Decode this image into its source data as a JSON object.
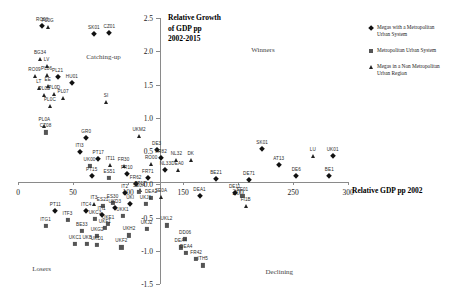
{
  "chart_data": {
    "type": "scatter",
    "title": "",
    "xlabel": "Relative GDP pp 2002",
    "ylabel": "Relative Growth of GDP pp 2002-2015",
    "ylabel_lines": [
      "Relative Growth",
      "of GDP pp",
      "2002-2015"
    ],
    "xlim": [
      0,
      300
    ],
    "ylim": [
      -1.5,
      2.5
    ],
    "xticks": [
      0,
      50,
      100,
      150,
      200,
      250,
      300
    ],
    "xtick_labels": [
      "0",
      "50",
      "100",
      "150",
      "200",
      "250",
      "300"
    ],
    "yticks": [
      -1.5,
      -1.0,
      -0.5,
      0.0,
      0.5,
      1.0,
      1.5,
      2.0,
      2.5
    ],
    "ytick_labels": [
      "-1.5",
      "-1.0",
      "-0.5",
      "0.0",
      "0.5",
      "1.0",
      "1.5",
      "2.0",
      "2.5"
    ],
    "grid": false,
    "legend_position": "top-right",
    "legend": [
      {
        "label": "Megas with a Metropolitan Urban System",
        "marker": "diamond",
        "color": "#111111"
      },
      {
        "label": "Metropolitan Urban System",
        "marker": "square",
        "color": "#555555"
      },
      {
        "label": "Megas in a Non Metropolitan Urban Region",
        "marker": "triangle",
        "color": "#222222"
      }
    ],
    "annotations": [
      {
        "text": "Catching-up",
        "x": 62,
        "y": 1.97
      },
      {
        "text": "Winners",
        "x": 212,
        "y": 2.08
      },
      {
        "text": "Losers",
        "x": 13,
        "y": -1.22
      },
      {
        "text": "Declining",
        "x": 225,
        "y": -1.26
      }
    ],
    "points": [
      {
        "label": "RO08",
        "x": 22,
        "y": 2.38,
        "marker": "diamond"
      },
      {
        "label": "PL0G",
        "x": 27,
        "y": 2.36,
        "marker": "triangle"
      },
      {
        "label": "SK01",
        "x": 69,
        "y": 2.26,
        "marker": "diamond"
      },
      {
        "label": "CZ01",
        "x": 83,
        "y": 2.27,
        "marker": "diamond"
      },
      {
        "label": "BG34",
        "x": 20,
        "y": 1.88,
        "marker": "triangle"
      },
      {
        "label": "LV",
        "x": 26,
        "y": 1.78,
        "marker": "triangle"
      },
      {
        "label": "RO09",
        "x": 15,
        "y": 1.63,
        "marker": "triangle"
      },
      {
        "label": "PL06",
        "x": 26,
        "y": 1.64,
        "marker": "triangle"
      },
      {
        "label": "PL21",
        "x": 36,
        "y": 1.62,
        "marker": "diamond"
      },
      {
        "label": "HU01",
        "x": 49,
        "y": 1.52,
        "marker": "diamond"
      },
      {
        "label": "LT",
        "x": 19,
        "y": 1.45,
        "marker": "triangle"
      },
      {
        "label": "EE",
        "x": 27,
        "y": 1.47,
        "marker": "triangle"
      },
      {
        "label": "PL0B",
        "x": 24,
        "y": 1.34,
        "marker": "triangle"
      },
      {
        "label": "PL0D",
        "x": 33,
        "y": 1.35,
        "marker": "triangle"
      },
      {
        "label": "PL07",
        "x": 41,
        "y": 1.3,
        "marker": "triangle"
      },
      {
        "label": "SI",
        "x": 80,
        "y": 1.24,
        "marker": "triangle"
      },
      {
        "label": "PL0C",
        "x": 29,
        "y": 1.18,
        "marker": "triangle"
      },
      {
        "label": "PL0A",
        "x": 24,
        "y": 0.88,
        "marker": "triangle"
      },
      {
        "label": "CZ08",
        "x": 25,
        "y": 0.78,
        "marker": "square"
      },
      {
        "label": "GR0",
        "x": 62,
        "y": 0.7,
        "marker": "diamond"
      },
      {
        "label": "UKM2",
        "x": 110,
        "y": 0.72,
        "marker": "triangle"
      },
      {
        "label": "ITI3",
        "x": 56,
        "y": 0.49,
        "marker": "diamond"
      },
      {
        "label": "DE3",
        "x": 126,
        "y": 0.52,
        "marker": "diamond"
      },
      {
        "label": "SK01",
        "x": 222,
        "y": 0.53,
        "marker": "diamond"
      },
      {
        "label": "LU",
        "x": 268,
        "y": 0.43,
        "marker": "triangle"
      },
      {
        "label": "UK01",
        "x": 286,
        "y": 0.43,
        "marker": "diamond"
      },
      {
        "label": "PT17",
        "x": 73,
        "y": 0.38,
        "marker": "diamond"
      },
      {
        "label": "FR82",
        "x": 130,
        "y": 0.4,
        "marker": "diamond"
      },
      {
        "label": "AT13",
        "x": 237,
        "y": 0.29,
        "marker": "diamond"
      },
      {
        "label": "RO00",
        "x": 121,
        "y": 0.31,
        "marker": "triangle"
      },
      {
        "label": "NL32",
        "x": 144,
        "y": 0.36,
        "marker": "triangle"
      },
      {
        "label": "DK",
        "x": 157,
        "y": 0.36,
        "marker": "triangle"
      },
      {
        "label": "UK00",
        "x": 65,
        "y": 0.27,
        "marker": "square"
      },
      {
        "label": "IT11",
        "x": 84,
        "y": 0.29,
        "marker": "triangle"
      },
      {
        "label": "FR30",
        "x": 96,
        "y": 0.27,
        "marker": "triangle"
      },
      {
        "label": "NL33",
        "x": 134,
        "y": 0.22,
        "marker": "diamond"
      },
      {
        "label": "DEA0",
        "x": 145,
        "y": 0.21,
        "marker": "triangle"
      },
      {
        "label": "FR10",
        "x": 99,
        "y": 0.16,
        "marker": "diamond"
      },
      {
        "label": "PT15",
        "x": 67,
        "y": 0.13,
        "marker": "diamond"
      },
      {
        "label": "ES51",
        "x": 83,
        "y": 0.1,
        "marker": "square"
      },
      {
        "label": "FR71",
        "x": 118,
        "y": 0.1,
        "marker": "diamond"
      },
      {
        "label": "DE6",
        "x": 253,
        "y": 0.12,
        "marker": "diamond"
      },
      {
        "label": "BE1",
        "x": 283,
        "y": 0.12,
        "marker": "diamond"
      },
      {
        "label": "DE71",
        "x": 210,
        "y": 0.07,
        "marker": "diamond"
      },
      {
        "label": "BE21",
        "x": 180,
        "y": 0.08,
        "marker": "diamond"
      },
      {
        "label": "FR62",
        "x": 107,
        "y": 0.01,
        "marker": "diamond"
      },
      {
        "label": "PT17",
        "x": 111,
        "y": -0.08,
        "marker": "triangle"
      },
      {
        "label": "IT2",
        "x": 97,
        "y": -0.13,
        "marker": "diamond"
      },
      {
        "label": "SE0A",
        "x": 110,
        "y": -0.12,
        "marker": "square"
      },
      {
        "label": "DE11",
        "x": 197,
        "y": -0.13,
        "marker": "diamond"
      },
      {
        "label": "SE01",
        "x": 204,
        "y": -0.17,
        "marker": "square"
      },
      {
        "label": "DEA1",
        "x": 165,
        "y": -0.18,
        "marker": "diamond"
      },
      {
        "label": "SE0A",
        "x": 130,
        "y": -0.19,
        "marker": "triangle"
      },
      {
        "label": "DEA2",
        "x": 121,
        "y": -0.2,
        "marker": "square"
      },
      {
        "label": "ES30",
        "x": 86,
        "y": -0.28,
        "marker": "square"
      },
      {
        "label": "FI1B",
        "x": 207,
        "y": -0.32,
        "marker": "triangle"
      },
      {
        "label": "IT3",
        "x": 69,
        "y": -0.3,
        "marker": "triangle"
      },
      {
        "label": "ES21",
        "x": 77,
        "y": -0.33,
        "marker": "square"
      },
      {
        "label": "UKD3",
        "x": 88,
        "y": -0.35,
        "marker": "diamond"
      },
      {
        "label": "UKI",
        "x": 102,
        "y": -0.3,
        "marker": "diamond"
      },
      {
        "label": "UKJ1",
        "x": 116,
        "y": -0.3,
        "marker": "square"
      },
      {
        "label": "UKK1",
        "x": 95,
        "y": -0.48,
        "marker": "square"
      },
      {
        "label": "ITI1",
        "x": 76,
        "y": -0.46,
        "marker": "diamond"
      },
      {
        "label": "UKC3",
        "x": 70,
        "y": -0.52,
        "marker": "square"
      },
      {
        "label": "ITC4",
        "x": 62,
        "y": -0.4,
        "marker": "diamond"
      },
      {
        "label": "ITF3",
        "x": 45,
        "y": -0.54,
        "marker": "square"
      },
      {
        "label": "UKE1",
        "x": 82,
        "y": -0.6,
        "marker": "square"
      },
      {
        "label": "UKF1",
        "x": 79,
        "y": -0.66,
        "marker": "square"
      },
      {
        "label": "UKG2",
        "x": 72,
        "y": -0.78,
        "marker": "square"
      },
      {
        "label": "BE33",
        "x": 58,
        "y": -0.7,
        "marker": "square"
      },
      {
        "label": "UKH2",
        "x": 101,
        "y": -0.77,
        "marker": "square"
      },
      {
        "label": "UKC1",
        "x": 52,
        "y": -0.9,
        "marker": "square"
      },
      {
        "label": "UKB",
        "x": 63,
        "y": -0.9,
        "marker": "square"
      },
      {
        "label": "UKD1",
        "x": 72,
        "y": -0.91,
        "marker": "square"
      },
      {
        "label": "UKF2",
        "x": 94,
        "y": -0.95,
        "marker": "square"
      },
      {
        "label": "UKJ2",
        "x": 117,
        "y": -0.67,
        "marker": "square"
      },
      {
        "label": "UKL2",
        "x": 135,
        "y": -0.62,
        "marker": "square"
      },
      {
        "label": "DD06",
        "x": 152,
        "y": -0.82,
        "marker": "square"
      },
      {
        "label": "DEA4",
        "x": 148,
        "y": -0.95,
        "marker": "square"
      },
      {
        "label": "DEA4",
        "x": 153,
        "y": -1.03,
        "marker": "square"
      },
      {
        "label": "FR42",
        "x": 162,
        "y": -1.12,
        "marker": "square"
      },
      {
        "label": "ITH5",
        "x": 168,
        "y": -1.22,
        "marker": "square"
      },
      {
        "label": "PT11",
        "x": 34,
        "y": -0.4,
        "marker": "diamond"
      },
      {
        "label": "ITG1",
        "x": 25,
        "y": -0.63,
        "marker": "square"
      }
    ]
  }
}
